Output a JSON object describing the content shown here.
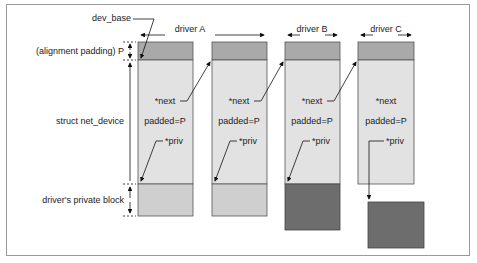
{
  "labels": {
    "dev_base": "dev_base",
    "alignment_padding": "(alignment padding) P",
    "struct_net_device": "struct net_device",
    "private_block": "driver's private block"
  },
  "drivers": [
    {
      "name": "driver A",
      "next": "*next",
      "padded": "padded=P",
      "priv": "*priv"
    },
    {
      "name": "driver B",
      "next": "*next",
      "padded": "padded=P",
      "priv": "*priv"
    },
    {
      "name": "driver C",
      "next": "*next",
      "padded": "padded=P",
      "priv": "*priv"
    }
  ],
  "first_struct": {
    "next": "*next",
    "padded": "padded=P",
    "priv": "*priv"
  },
  "colors": {
    "padding_fill": "#a9a9a9",
    "body_fill": "#e2e2e2",
    "private_light": "#cfcfcf",
    "private_dark": "#6d6d6d",
    "stroke": "#555555"
  }
}
